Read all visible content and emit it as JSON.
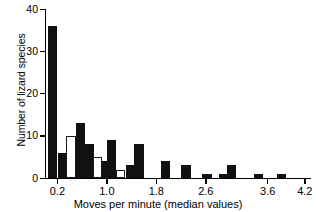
{
  "chart_data": {
    "type": "bar",
    "title": "",
    "subtitle": "",
    "xlabel": "Moves per minute (median values)",
    "ylabel": "Number of lizard species",
    "xlim": [
      0.0,
      4.3
    ],
    "ylim": [
      0,
      40
    ],
    "grid": false,
    "legend": null,
    "x_tick_labels": [
      "0.2",
      "1.0",
      "1.8",
      "2.6",
      "3.6",
      "4.2"
    ],
    "x_tick_values": [
      0.2,
      1.0,
      1.8,
      2.6,
      3.6,
      4.2
    ],
    "y_tick_labels": [
      "0",
      "10",
      "20",
      "30",
      "40"
    ],
    "y_tick_values": [
      0,
      10,
      20,
      30,
      40
    ],
    "bar_style_note": "two interleaved groups: filled black bars and open white bars",
    "series": [
      {
        "name": "filled",
        "fill": "#111111",
        "points": [
          {
            "x": 0.12,
            "value": 36
          },
          {
            "x": 0.28,
            "value": 6
          },
          {
            "x": 0.58,
            "value": 13
          },
          {
            "x": 0.72,
            "value": 8
          },
          {
            "x": 0.95,
            "value": 4
          },
          {
            "x": 1.08,
            "value": 9
          },
          {
            "x": 1.38,
            "value": 3
          },
          {
            "x": 1.52,
            "value": 8
          },
          {
            "x": 1.95,
            "value": 4
          },
          {
            "x": 2.28,
            "value": 3
          },
          {
            "x": 2.62,
            "value": 1
          },
          {
            "x": 2.88,
            "value": 1
          },
          {
            "x": 3.02,
            "value": 3
          },
          {
            "x": 3.45,
            "value": 1
          },
          {
            "x": 3.82,
            "value": 1
          }
        ]
      },
      {
        "name": "open",
        "fill": "#ffffff",
        "points": [
          {
            "x": 0.42,
            "value": 10
          },
          {
            "x": 0.85,
            "value": 5
          },
          {
            "x": 1.22,
            "value": 2
          }
        ]
      }
    ],
    "values_note": "Heights read against the 0-40 y-axis; long right tail of single-species bins."
  },
  "axes": {
    "y_title": "Number of lizard species",
    "x_title": "Moves per minute (median values)"
  }
}
